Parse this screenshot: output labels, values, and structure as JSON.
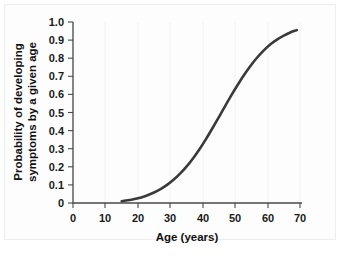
{
  "figure": {
    "background_color": "#ffffff",
    "frame_color": "#ededed"
  },
  "chart_data": {
    "type": "line",
    "title": "",
    "subtitle": "",
    "xlabel": "Age (years)",
    "ylabel": "Probability of developing symptoms by a given age",
    "ylabel_lines": [
      "Probability of developing",
      "symptoms by a given age"
    ],
    "xlim": [
      0,
      70
    ],
    "ylim": [
      0,
      1.0
    ],
    "xticks": [
      0,
      10,
      20,
      30,
      40,
      50,
      60,
      70
    ],
    "xtick_labels": [
      "0",
      "10",
      "20",
      "30",
      "40",
      "50",
      "60",
      "70"
    ],
    "yticks": [
      0,
      0.1,
      0.2,
      0.3,
      0.4,
      0.5,
      0.6,
      0.7,
      0.8,
      0.9,
      1.0
    ],
    "ytick_labels": [
      "0",
      "0.1",
      "0.2",
      "0.3",
      "0.4",
      "0.5",
      "0.6",
      "0.7",
      "0.8",
      "0.9",
      "1.0"
    ],
    "grid": true,
    "grid_axis": "x",
    "legend": false,
    "legend_position": "none",
    "curve_color": "#3a3a3a",
    "curve_width": 2.6,
    "series": [
      {
        "name": "Cumulative probability of symptom onset",
        "x": [
          15,
          17,
          19,
          21,
          23,
          25,
          27,
          29,
          31,
          33,
          35,
          37,
          39,
          41,
          43,
          45,
          47,
          49,
          51,
          53,
          55,
          57,
          59,
          61,
          63,
          65,
          67,
          69
        ],
        "values": [
          0.01,
          0.015,
          0.022,
          0.031,
          0.043,
          0.058,
          0.077,
          0.1,
          0.128,
          0.162,
          0.201,
          0.246,
          0.297,
          0.353,
          0.413,
          0.475,
          0.538,
          0.6,
          0.659,
          0.714,
          0.764,
          0.808,
          0.846,
          0.878,
          0.904,
          0.925,
          0.942,
          0.955
        ]
      }
    ],
    "annotations": {
      "curve_start_age": 15,
      "curve_end_age": 69,
      "inflection_age": 48,
      "value_at_inflection": 0.5,
      "value_at_end": 0.955
    }
  }
}
